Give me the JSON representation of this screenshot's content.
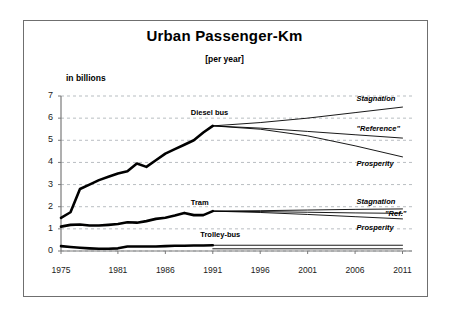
{
  "figure": {
    "title": "Urban Passenger-Km",
    "subtitle": "[per year]",
    "ylabel": "in billions"
  },
  "chart_data": {
    "type": "line",
    "title": "Urban Passenger-Km",
    "subtitle": "[per year]",
    "xlabel": "",
    "ylabel": "in billions",
    "xlim": [
      1975,
      2012
    ],
    "ylim": [
      0,
      7
    ],
    "grid": true,
    "grid_axis": "y",
    "legend": "inline-annotations",
    "xticks": [
      "1975",
      "1981",
      "1986",
      "1991",
      "1996",
      "2001",
      "2006",
      "2011"
    ],
    "xtick_values": [
      1975,
      1981,
      1986,
      1991,
      1996,
      2001,
      2006,
      2011
    ],
    "yticks": [
      "0",
      "1",
      "2",
      "3",
      "4",
      "5",
      "6",
      "7"
    ],
    "ytick_values": [
      0,
      1,
      2,
      3,
      4,
      5,
      6,
      7
    ],
    "history_x": [
      1975,
      1976,
      1977,
      1978,
      1979,
      1980,
      1981,
      1982,
      1983,
      1984,
      1985,
      1986,
      1987,
      1988,
      1989,
      1990,
      1991
    ],
    "series": [
      {
        "name": "Diesel bus",
        "label": "Diesel bus",
        "kind": "history",
        "values": [
          1.5,
          1.75,
          2.8,
          3.0,
          3.2,
          3.35,
          3.5,
          3.6,
          3.95,
          3.8,
          4.1,
          4.4,
          4.6,
          4.8,
          5.0,
          5.35,
          5.65
        ]
      },
      {
        "name": "Tram",
        "label": "Tram",
        "kind": "history",
        "values": [
          1.1,
          1.18,
          1.2,
          1.15,
          1.15,
          1.18,
          1.22,
          1.3,
          1.28,
          1.35,
          1.45,
          1.5,
          1.6,
          1.72,
          1.62,
          1.62,
          1.8
        ]
      },
      {
        "name": "Trolley-bus",
        "label": "Trolley-bus",
        "kind": "history",
        "values": [
          0.22,
          0.18,
          0.15,
          0.12,
          0.1,
          0.1,
          0.12,
          0.2,
          0.2,
          0.2,
          0.2,
          0.22,
          0.24,
          0.24,
          0.25,
          0.25,
          0.26
        ]
      }
    ],
    "projections": [
      {
        "group": "Diesel bus",
        "scenario": "Stagnation",
        "label": "Stagnation",
        "x": [
          1991,
          1996,
          2001,
          2006,
          2011
        ],
        "values": [
          5.65,
          5.8,
          6.0,
          6.25,
          6.5
        ]
      },
      {
        "group": "Diesel bus",
        "scenario": "Reference",
        "label": "\"Reference\"",
        "x": [
          1991,
          1996,
          2001,
          2006,
          2011
        ],
        "values": [
          5.65,
          5.55,
          5.4,
          5.25,
          5.1
        ]
      },
      {
        "group": "Diesel bus",
        "scenario": "Prosperity",
        "label": "Prosperity",
        "x": [
          1991,
          1996,
          2001,
          2006,
          2011
        ],
        "values": [
          5.65,
          5.5,
          5.2,
          4.75,
          4.25
        ]
      },
      {
        "group": "Tram",
        "scenario": "Stagnation",
        "label": "Stagnation",
        "x": [
          1991,
          1996,
          2001,
          2006,
          2011
        ],
        "values": [
          1.8,
          1.82,
          1.85,
          1.88,
          1.9
        ]
      },
      {
        "group": "Tram",
        "scenario": "Reference",
        "label": "\"Ref.\"",
        "x": [
          1991,
          1996,
          2001,
          2006,
          2011
        ],
        "values": [
          1.8,
          1.78,
          1.75,
          1.72,
          1.7
        ]
      },
      {
        "group": "Tram",
        "scenario": "Prosperity",
        "label": "Prosperity",
        "x": [
          1991,
          1996,
          2001,
          2006,
          2011
        ],
        "values": [
          1.8,
          1.74,
          1.65,
          1.55,
          1.45
        ]
      },
      {
        "group": "Trolley-bus",
        "scenario": "upper",
        "label": "",
        "x": [
          1991,
          2011
        ],
        "values": [
          0.26,
          0.26
        ]
      },
      {
        "group": "Trolley-bus",
        "scenario": "lower",
        "label": "",
        "x": [
          1991,
          2011
        ],
        "values": [
          0.1,
          0.1
        ]
      }
    ],
    "annotations": [
      {
        "text": "Diesel bus",
        "x": 1991,
        "y": 6.25
      },
      {
        "text": "Tram",
        "x": 1991,
        "y": 2.15
      },
      {
        "text": "Trolley-bus",
        "x": 1992,
        "y": 0.72
      },
      {
        "text": "Stagnation",
        "x": 2007,
        "y": 6.85
      },
      {
        "text": "\"Reference\"",
        "x": 2007,
        "y": 5.5
      },
      {
        "text": "Prosperity",
        "x": 2007,
        "y": 3.95
      },
      {
        "text": "Stagnation",
        "x": 2007,
        "y": 2.2
      },
      {
        "text": "\"Ref.\"",
        "x": 2010,
        "y": 1.65
      },
      {
        "text": "Prosperity",
        "x": 2007,
        "y": 1.05
      }
    ]
  },
  "colors": {
    "line": "#000000",
    "grid": "#9aa0a6",
    "axis": "#7a7a7a",
    "frame": "#6f6f6f",
    "background": "#ffffff"
  }
}
